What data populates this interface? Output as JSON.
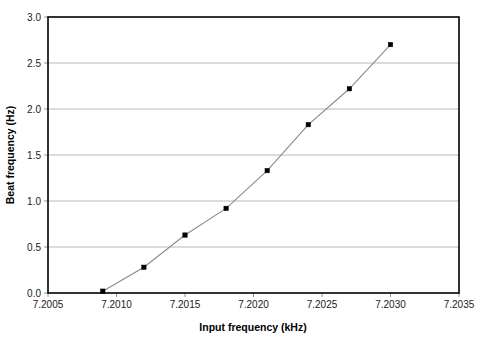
{
  "chart_data": {
    "type": "line",
    "title": "",
    "xlabel": "Input frequency (kHz)",
    "ylabel": "Beat frequency (Hz)",
    "xlim": [
      7.2005,
      7.2035
    ],
    "ylim": [
      0.0,
      3.0
    ],
    "grid": true,
    "grid_axis": "y",
    "legend": "none",
    "xticks": [
      7.2005,
      7.201,
      7.2015,
      7.202,
      7.2025,
      7.203,
      7.2035
    ],
    "xtick_labels": [
      "7.2005",
      "7.2010",
      "7.2015",
      "7.2020",
      "7.2025",
      "7.2030",
      "7.2035"
    ],
    "yticks": [
      0.0,
      0.5,
      1.0,
      1.5,
      2.0,
      2.5,
      3.0
    ],
    "ytick_labels": [
      "0.0",
      "0.5",
      "1.0",
      "1.5",
      "2.0",
      "2.5",
      "3.0"
    ],
    "series": [
      {
        "name": "Beat frequency",
        "marker": "square",
        "marker_color": "#000000",
        "line_color": "#8a8a8a",
        "x": [
          7.2009,
          7.2012,
          7.2015,
          7.2018,
          7.2021,
          7.2024,
          7.2027,
          7.203
        ],
        "values": [
          0.02,
          0.28,
          0.63,
          0.92,
          1.33,
          1.83,
          2.22,
          2.7
        ]
      }
    ]
  },
  "style": {
    "background": "#ffffff",
    "frame_color": "#000000",
    "gridline_color": "#a6a6a6",
    "text_color": "#1a1a1a"
  }
}
